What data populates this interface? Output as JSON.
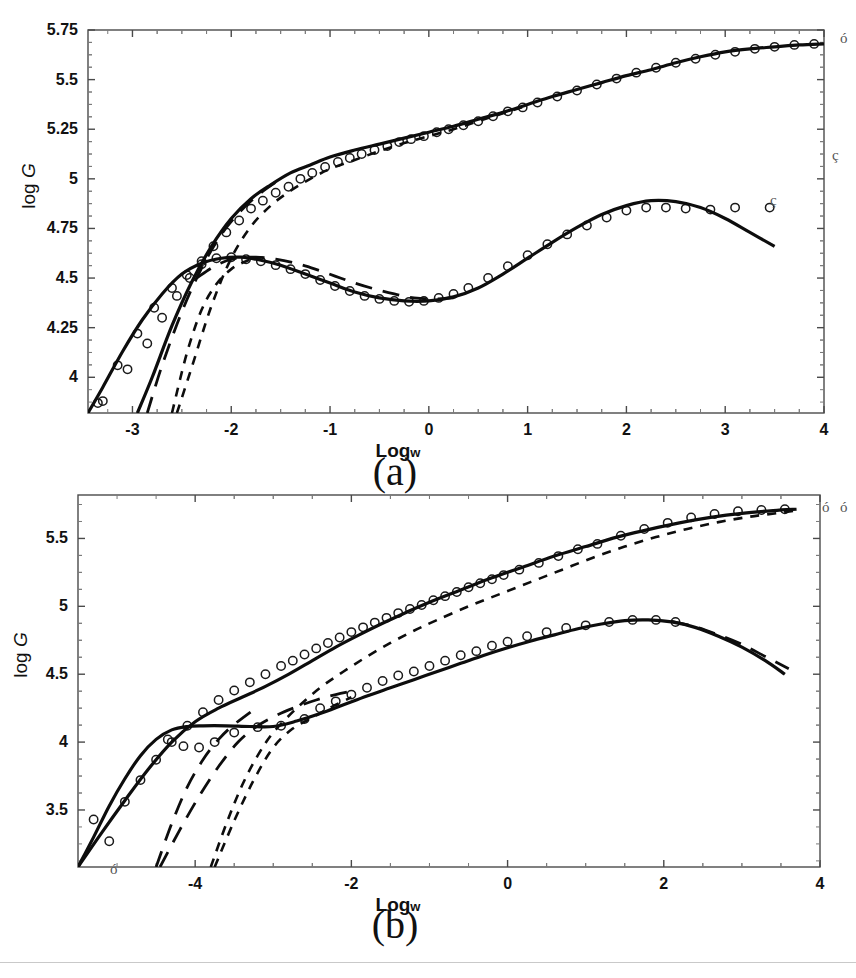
{
  "figure": {
    "panels": [
      {
        "id": "a",
        "label": "(a)",
        "xlabel_main": "Log",
        "xlabel_sub": "w",
        "ylabel_main": "log ",
        "ylabel_var": "G",
        "xticks": [
          "-3",
          "-2",
          "-1",
          "0",
          "1",
          "2",
          "3",
          "4"
        ],
        "yticks": [
          "4",
          "4.25",
          "4.5",
          "4.75",
          "5",
          "5.25",
          "5.5",
          "5.75"
        ],
        "stray_marks": [
          "ó",
          "ç",
          "ç"
        ]
      },
      {
        "id": "b",
        "label": "(b)",
        "xlabel_main": "Log",
        "xlabel_sub": "w",
        "ylabel_main": "log ",
        "ylabel_var": "G",
        "xticks": [
          "-4",
          "-2",
          "0",
          "2",
          "4"
        ],
        "yticks": [
          "3.5",
          "4",
          "4.5",
          "5",
          "5.5"
        ],
        "stray_marks": [
          "ó",
          "ó",
          "ó"
        ]
      }
    ]
  },
  "chart_data": [
    {
      "type": "line",
      "panel": "a",
      "title": "",
      "xlabel": "Log w",
      "ylabel": "log G",
      "xlim": [
        -3.45,
        4.0
      ],
      "ylim": [
        3.82,
        5.75
      ],
      "xticks": [
        -3,
        -2,
        -1,
        0,
        1,
        2,
        3,
        4
      ],
      "yticks": [
        4,
        4.25,
        4.5,
        4.75,
        5,
        5.25,
        5.5,
        5.75
      ],
      "grid": false,
      "legend": "none",
      "minor_ticks_per_interval": 4,
      "series": [
        {
          "name": "storage modulus - solid (upper)",
          "style": "solid",
          "linewidth": 3.2,
          "x": [
            -2.95,
            -2.8,
            -2.6,
            -2.4,
            -2.2,
            -2.0,
            -1.8,
            -1.6,
            -1.4,
            -1.2,
            -1.0,
            -0.75,
            -0.5,
            -0.25,
            0.0,
            0.25,
            0.5,
            0.75,
            1.0,
            1.25,
            1.5,
            1.75,
            2.0,
            2.25,
            2.5,
            2.75,
            3.0,
            3.25,
            3.5,
            3.75,
            4.0
          ],
          "y": [
            3.82,
            4.0,
            4.26,
            4.48,
            4.66,
            4.8,
            4.9,
            4.97,
            5.03,
            5.07,
            5.11,
            5.145,
            5.175,
            5.205,
            5.235,
            5.265,
            5.3,
            5.335,
            5.375,
            5.415,
            5.45,
            5.485,
            5.52,
            5.55,
            5.585,
            5.615,
            5.64,
            5.655,
            5.665,
            5.675,
            5.68
          ]
        },
        {
          "name": "storage modulus - short dash (upper)",
          "style": "dashed-short",
          "linewidth": 2.6,
          "x": [
            -2.55,
            -2.4,
            -2.2,
            -2.0,
            -1.8,
            -1.6,
            -1.4,
            -1.2,
            -1.0,
            -0.75,
            -0.5,
            -0.25,
            0.0,
            0.25,
            0.5,
            0.75,
            1.0
          ],
          "y": [
            3.82,
            4.05,
            4.36,
            4.6,
            4.76,
            4.865,
            4.94,
            5.0,
            5.05,
            5.095,
            5.14,
            5.18,
            5.215,
            5.25,
            5.29,
            5.33,
            5.37
          ]
        },
        {
          "name": "storage modulus - long dash (upper)",
          "style": "dashed-long",
          "linewidth": 2.8,
          "x": [
            -2.85,
            -2.7,
            -2.5,
            -2.3,
            -2.1,
            -1.9,
            -1.7,
            -1.5
          ],
          "y": [
            3.82,
            4.06,
            4.33,
            4.55,
            4.72,
            4.84,
            4.93,
            5.0
          ]
        },
        {
          "name": "loss modulus - solid (lower)",
          "style": "solid",
          "linewidth": 3.2,
          "x": [
            -3.45,
            -3.3,
            -3.1,
            -2.9,
            -2.7,
            -2.5,
            -2.3,
            -2.1,
            -1.9,
            -1.7,
            -1.5,
            -1.25,
            -1.0,
            -0.75,
            -0.5,
            -0.25,
            0.0,
            0.25,
            0.5,
            0.75,
            1.0,
            1.25,
            1.5,
            1.75,
            2.0,
            2.25,
            2.5,
            2.75,
            3.0,
            3.25,
            3.5
          ],
          "y": [
            3.82,
            3.95,
            4.13,
            4.29,
            4.42,
            4.52,
            4.575,
            4.6,
            4.605,
            4.59,
            4.565,
            4.52,
            4.475,
            4.43,
            4.4,
            4.385,
            4.385,
            4.405,
            4.45,
            4.52,
            4.6,
            4.68,
            4.755,
            4.82,
            4.865,
            4.89,
            4.885,
            4.855,
            4.8,
            4.73,
            4.66
          ]
        },
        {
          "name": "loss modulus - long dash (lower)",
          "style": "dashed-long",
          "linewidth": 2.8,
          "x": [
            -2.35,
            -2.15,
            -1.95,
            -1.75,
            -1.55,
            -1.35,
            -1.15,
            -0.95,
            -0.75,
            -0.55,
            -0.35,
            -0.15,
            0.05,
            0.25
          ],
          "y": [
            4.5,
            4.565,
            4.6,
            4.605,
            4.595,
            4.575,
            4.545,
            4.51,
            4.475,
            4.445,
            4.42,
            4.4,
            4.395,
            4.4
          ]
        },
        {
          "name": "loss modulus - short dash (lower)",
          "style": "dashed-short",
          "linewidth": 2.6,
          "x": [
            -2.6,
            -2.45,
            -2.3,
            -2.15,
            -2.0,
            -1.85,
            -1.7
          ],
          "y": [
            3.82,
            4.12,
            4.34,
            4.47,
            4.545,
            4.585,
            4.605
          ]
        }
      ],
      "markers": {
        "symbol": "open-circle",
        "upper_x": [
          -3.3,
          -3.05,
          -2.85,
          -2.7,
          -2.55,
          -2.42,
          -2.3,
          -2.18,
          -2.05,
          -1.92,
          -1.8,
          -1.68,
          -1.55,
          -1.42,
          -1.3,
          -1.18,
          -1.05,
          -0.92,
          -0.8,
          -0.68,
          -0.55,
          -0.42,
          -0.3,
          -0.18,
          -0.05,
          0.08,
          0.2,
          0.35,
          0.5,
          0.65,
          0.8,
          0.95,
          1.1,
          1.3,
          1.5,
          1.7,
          1.9,
          2.1,
          2.3,
          2.5,
          2.7,
          2.9,
          3.1,
          3.3,
          3.5,
          3.7,
          3.9
        ],
        "upper_y": [
          3.88,
          4.04,
          4.17,
          4.3,
          4.41,
          4.5,
          4.585,
          4.66,
          4.73,
          4.79,
          4.85,
          4.89,
          4.93,
          4.96,
          5.0,
          5.03,
          5.06,
          5.085,
          5.105,
          5.125,
          5.145,
          5.165,
          5.185,
          5.2,
          5.215,
          5.235,
          5.25,
          5.27,
          5.29,
          5.315,
          5.34,
          5.36,
          5.385,
          5.415,
          5.445,
          5.475,
          5.505,
          5.535,
          5.56,
          5.585,
          5.605,
          5.625,
          5.64,
          5.655,
          5.665,
          5.675,
          5.68
        ],
        "lower_x": [
          -3.35,
          -3.15,
          -2.95,
          -2.78,
          -2.6,
          -2.45,
          -2.3,
          -2.15,
          -2.0,
          -1.85,
          -1.7,
          -1.55,
          -1.4,
          -1.25,
          -1.1,
          -0.95,
          -0.8,
          -0.65,
          -0.5,
          -0.35,
          -0.2,
          -0.05,
          0.1,
          0.25,
          0.4,
          0.6,
          0.8,
          1.0,
          1.2,
          1.4,
          1.6,
          1.8,
          2.0,
          2.2,
          2.4,
          2.6,
          2.85,
          3.1,
          3.45
        ],
        "lower_y": [
          3.87,
          4.06,
          4.22,
          4.35,
          4.45,
          4.515,
          4.57,
          4.6,
          4.605,
          4.595,
          4.585,
          4.565,
          4.545,
          4.52,
          4.49,
          4.46,
          4.435,
          4.41,
          4.395,
          4.385,
          4.38,
          4.385,
          4.4,
          4.42,
          4.45,
          4.5,
          4.56,
          4.615,
          4.67,
          4.72,
          4.765,
          4.805,
          4.84,
          4.855,
          4.855,
          4.85,
          4.845,
          4.855,
          4.855
        ]
      }
    },
    {
      "type": "line",
      "panel": "b",
      "title": "",
      "xlabel": "Log w",
      "ylabel": "log G",
      "xlim": [
        -5.5,
        4.0
      ],
      "ylim": [
        3.08,
        5.82
      ],
      "xticks": [
        -4,
        -2,
        0,
        2,
        4
      ],
      "yticks": [
        3.5,
        4,
        4.5,
        5,
        5.5
      ],
      "grid": false,
      "legend": "none",
      "minor_ticks_per_interval": 4,
      "series": [
        {
          "name": "storage modulus - solid (upper)",
          "style": "solid",
          "linewidth": 3.2,
          "x": [
            -5.5,
            -5.2,
            -4.9,
            -4.6,
            -4.3,
            -4.0,
            -3.7,
            -3.4,
            -3.1,
            -2.8,
            -2.5,
            -2.2,
            -1.9,
            -1.6,
            -1.3,
            -1.0,
            -0.6,
            -0.2,
            0.2,
            0.6,
            1.0,
            1.4,
            1.8,
            2.2,
            2.6,
            3.0,
            3.4,
            3.7
          ],
          "y": [
            3.08,
            3.33,
            3.57,
            3.8,
            4.0,
            4.15,
            4.25,
            4.33,
            4.41,
            4.5,
            4.6,
            4.7,
            4.79,
            4.875,
            4.955,
            5.03,
            5.12,
            5.21,
            5.29,
            5.37,
            5.44,
            5.51,
            5.565,
            5.615,
            5.655,
            5.685,
            5.705,
            5.715
          ]
        },
        {
          "name": "storage modulus - short dash (upper)",
          "style": "dashed-short",
          "linewidth": 2.6,
          "x": [
            -3.8,
            -3.6,
            -3.4,
            -3.2,
            -3.0,
            -2.7,
            -2.4,
            -2.1,
            -1.8,
            -1.5,
            -1.2,
            -0.9,
            -0.5,
            -0.1,
            0.3,
            0.7,
            1.1,
            1.5,
            1.9,
            2.3,
            2.7,
            3.1,
            3.5,
            3.7
          ],
          "y": [
            3.08,
            3.4,
            3.68,
            3.9,
            4.07,
            4.25,
            4.4,
            4.52,
            4.63,
            4.73,
            4.82,
            4.9,
            5.0,
            5.09,
            5.18,
            5.27,
            5.36,
            5.44,
            5.51,
            5.57,
            5.62,
            5.66,
            5.69,
            5.705
          ]
        },
        {
          "name": "storage modulus - long dash (upper)",
          "style": "dashed-long",
          "linewidth": 2.8,
          "x": [
            -4.5,
            -4.3,
            -4.1,
            -3.9,
            -3.7,
            -3.5,
            -3.2
          ],
          "y": [
            3.08,
            3.4,
            3.67,
            3.87,
            4.02,
            4.13,
            4.26
          ]
        },
        {
          "name": "loss modulus - solid (lower)",
          "style": "solid",
          "linewidth": 3.2,
          "x": [
            -5.5,
            -5.3,
            -5.1,
            -4.9,
            -4.7,
            -4.5,
            -4.3,
            -4.1,
            -3.9,
            -3.6,
            -3.3,
            -3.0,
            -2.7,
            -2.4,
            -2.1,
            -1.8,
            -1.5,
            -1.2,
            -0.9,
            -0.6,
            -0.3,
            0.0,
            0.3,
            0.6,
            0.9,
            1.2,
            1.5,
            1.8,
            2.1,
            2.4,
            2.7,
            3.0,
            3.3,
            3.55
          ],
          "y": [
            3.08,
            3.3,
            3.53,
            3.73,
            3.9,
            4.02,
            4.09,
            4.115,
            4.12,
            4.12,
            4.115,
            4.115,
            4.155,
            4.21,
            4.275,
            4.34,
            4.4,
            4.46,
            4.52,
            4.58,
            4.64,
            4.695,
            4.745,
            4.79,
            4.835,
            4.87,
            4.895,
            4.9,
            4.885,
            4.845,
            4.78,
            4.7,
            4.6,
            4.5
          ]
        },
        {
          "name": "loss modulus - long dash (lower)",
          "style": "dashed-long",
          "linewidth": 2.8,
          "x": [
            -4.45,
            -4.2,
            -3.95,
            -3.7,
            -3.45,
            -3.2,
            -2.95,
            -2.7,
            -2.45,
            -2.2,
            -1.95
          ],
          "y": [
            3.08,
            3.35,
            3.6,
            3.82,
            4.0,
            4.12,
            4.2,
            4.26,
            4.31,
            4.35,
            4.38
          ]
        },
        {
          "name": "loss modulus - long dash tail (lower right)",
          "style": "dashed-long",
          "linewidth": 2.8,
          "x": [
            2.1,
            2.4,
            2.7,
            3.0,
            3.3,
            3.6
          ],
          "y": [
            4.89,
            4.85,
            4.79,
            4.72,
            4.63,
            4.54
          ]
        },
        {
          "name": "loss modulus - short dash (lower)",
          "style": "dashed-short",
          "linewidth": 2.6,
          "x": [
            -3.75,
            -3.5,
            -3.25,
            -3.0,
            -2.75,
            -2.5,
            -2.25,
            -2.0
          ],
          "y": [
            3.08,
            3.42,
            3.72,
            3.96,
            4.1,
            4.18,
            4.26,
            4.33
          ]
        }
      ],
      "markers": {
        "symbol": "open-circle",
        "upper_x": [
          -5.3,
          -5.1,
          -4.9,
          -4.7,
          -4.5,
          -4.3,
          -4.1,
          -3.9,
          -3.7,
          -3.5,
          -3.3,
          -3.1,
          -2.9,
          -2.75,
          -2.6,
          -2.45,
          -2.3,
          -2.15,
          -2.0,
          -1.85,
          -1.7,
          -1.55,
          -1.4,
          -1.25,
          -1.1,
          -0.95,
          -0.8,
          -0.65,
          -0.5,
          -0.35,
          -0.2,
          -0.05,
          0.15,
          0.4,
          0.65,
          0.9,
          1.15,
          1.45,
          1.75,
          2.05,
          2.35,
          2.65,
          2.95,
          3.25,
          3.55
        ],
        "upper_y": [
          3.43,
          3.27,
          3.56,
          3.72,
          3.87,
          4.0,
          4.12,
          4.22,
          4.31,
          4.38,
          4.44,
          4.5,
          4.56,
          4.6,
          4.645,
          4.69,
          4.73,
          4.77,
          4.81,
          4.845,
          4.88,
          4.915,
          4.95,
          4.98,
          5.01,
          5.045,
          5.075,
          5.105,
          5.14,
          5.17,
          5.2,
          5.23,
          5.27,
          5.32,
          5.37,
          5.42,
          5.46,
          5.52,
          5.57,
          5.615,
          5.655,
          5.68,
          5.7,
          5.71,
          5.715
        ],
        "lower_x": [
          -4.35,
          -4.15,
          -3.95,
          -3.75,
          -3.5,
          -3.2,
          -2.9,
          -2.6,
          -2.4,
          -2.2,
          -2.0,
          -1.8,
          -1.6,
          -1.4,
          -1.2,
          -1.0,
          -0.8,
          -0.6,
          -0.4,
          -0.2,
          0.0,
          0.25,
          0.5,
          0.75,
          1.0,
          1.3,
          1.6,
          1.9,
          2.15
        ],
        "lower_y": [
          4.02,
          3.97,
          3.96,
          4.0,
          4.07,
          4.11,
          4.12,
          4.17,
          4.25,
          4.3,
          4.35,
          4.4,
          4.45,
          4.49,
          4.52,
          4.56,
          4.6,
          4.64,
          4.67,
          4.71,
          4.74,
          4.78,
          4.81,
          4.84,
          4.86,
          4.885,
          4.9,
          4.9,
          4.885
        ]
      }
    }
  ]
}
